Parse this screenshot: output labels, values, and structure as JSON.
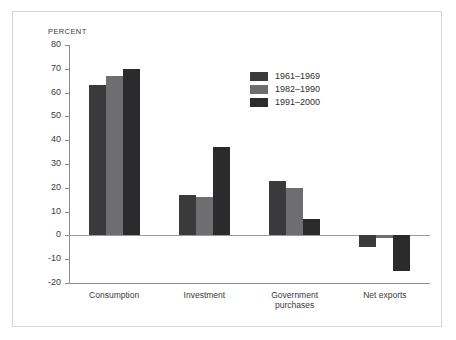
{
  "chart_data": {
    "type": "bar",
    "title": "",
    "subtitle": "",
    "xlabel": "",
    "ylabel": "PERCENT",
    "ylim": [
      -20,
      80
    ],
    "ytick_step": 10,
    "yticks": [
      80,
      70,
      60,
      50,
      40,
      30,
      20,
      10,
      0,
      -10,
      -20
    ],
    "ytick_labels": [
      "80",
      "70",
      "60",
      "50",
      "40",
      "30",
      "20",
      "10",
      "0",
      "-10",
      "-20"
    ],
    "grid": false,
    "legend_position": "upper-center-right",
    "categories": [
      "Consumption",
      "Investment",
      "Government\npurchases",
      "Net exports"
    ],
    "series": [
      {
        "name": "1961–1969",
        "color": "#3a3a3c",
        "values": [
          63,
          17,
          23,
          -5
        ]
      },
      {
        "name": "1982–1990",
        "color": "#6e6e70",
        "values": [
          67,
          16,
          20,
          -1
        ]
      },
      {
        "name": "1991–2000",
        "color": "#2b2b2d",
        "values": [
          70,
          37,
          7,
          -15
        ]
      }
    ]
  },
  "figure": {
    "background_color": "#ffffff",
    "border_color": "#d6d4d2",
    "axis_color": "#8c8c8c",
    "text_color": "#3a3a3a"
  }
}
